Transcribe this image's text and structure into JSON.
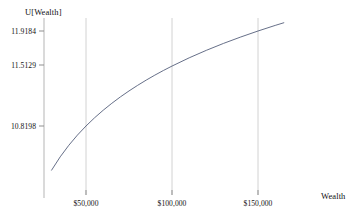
{
  "chart_data": {
    "type": "line",
    "title": "",
    "subtitle": "",
    "xlabel": "Wealth",
    "ylabel": "U[Wealth]",
    "function": "U = ln(Wealth)",
    "xlim": [
      25000,
      172000
    ],
    "ylim": [
      10.25,
      12.05
    ],
    "grid": true,
    "legend_position": "none",
    "xticks": [
      50000,
      100000,
      150000
    ],
    "xtick_labels": [
      "$50,000",
      "$100,000",
      "$150,000"
    ],
    "yticks": [
      10.8198,
      11.5129,
      11.9184
    ],
    "ytick_labels": [
      "10.8198",
      "11.5129",
      "11.9184"
    ],
    "series": [
      {
        "name": "U[Wealth]",
        "color": "#555f7a",
        "x": [
          30000,
          35000,
          40000,
          45000,
          50000,
          55000,
          60000,
          65000,
          70000,
          75000,
          80000,
          85000,
          90000,
          95000,
          100000,
          110000,
          120000,
          130000,
          140000,
          150000,
          160000,
          165000
        ],
        "y": [
          10.309,
          10.4631,
          10.5966,
          10.7144,
          10.8198,
          10.9151,
          11.0021,
          11.0821,
          11.1563,
          11.2252,
          11.2898,
          11.3504,
          11.4076,
          11.4617,
          11.5129,
          11.6082,
          11.6952,
          11.7753,
          11.8494,
          11.9184,
          11.9829,
          12.0137
        ]
      }
    ],
    "annotations": []
  },
  "axes": {
    "y_title": "U[Wealth]",
    "x_title": "Wealth"
  },
  "caption": {
    "text": ""
  },
  "colors": {
    "curve": "#555f7a",
    "grid": "#cfcfcf",
    "axis": "#b8b8b8",
    "text": "#111111",
    "background": "#ffffff"
  }
}
